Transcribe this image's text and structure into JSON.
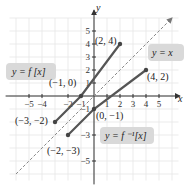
{
  "chart_data": {
    "type": "line",
    "title": "",
    "xlabel": "x",
    "ylabel": "y",
    "xlim": [
      -6,
      6
    ],
    "ylim": [
      -6,
      6
    ],
    "grid": true,
    "x_ticks": [
      "-5",
      "-4",
      "-2",
      "-1",
      "1",
      "2",
      "3",
      "4",
      "5"
    ],
    "y_ticks": [
      "5",
      "4",
      "3",
      "2",
      "1",
      "-1",
      "-3",
      "-5"
    ],
    "series": [
      {
        "name": "y = f(x)",
        "label": "y = f [x]",
        "points": [
          [
            -3,
            -2
          ],
          [
            -1,
            0
          ],
          [
            2,
            4
          ]
        ],
        "color": "#555555",
        "style": "solid"
      },
      {
        "name": "y = f^-1(x)",
        "label": "y = f ⁻¹[x]",
        "points": [
          [
            -2,
            -3
          ],
          [
            0,
            -1
          ],
          [
            4,
            2
          ]
        ],
        "color": "#555555",
        "style": "solid"
      },
      {
        "name": "y = x",
        "label": "y = x",
        "points": [
          [
            -6,
            -6
          ],
          [
            6,
            6
          ]
        ],
        "color": "#888888",
        "style": "dashed"
      }
    ],
    "annotations": [
      "(2, 4)",
      "(4, 2)",
      "(-1, 0)",
      "(0, -1)",
      "(-3, -2)",
      "(-2, -3)"
    ]
  },
  "labels": {
    "x_axis": "x",
    "y_axis": "y",
    "f": "y = f [x]",
    "finv": "y = f ⁻¹[x]",
    "identity": "y = x",
    "p24": "(2, 4)",
    "p42": "(4, 2)",
    "pm10": "(−1, 0)",
    "p0m1": "(0, −1)",
    "pm3m2": "(−3, −2)",
    "pm2m3": "(−2, −3)"
  },
  "ticks": {
    "x": [
      {
        "v": -5,
        "t": "−5"
      },
      {
        "v": -4,
        "t": "−4"
      },
      {
        "v": -2,
        "t": "−2"
      },
      {
        "v": -1,
        "t": "−1"
      },
      {
        "v": 1,
        "t": "1"
      },
      {
        "v": 2,
        "t": "2"
      },
      {
        "v": 3,
        "t": "3"
      },
      {
        "v": 4,
        "t": "4"
      },
      {
        "v": 5,
        "t": "5"
      }
    ],
    "y": [
      {
        "v": 5,
        "t": "5"
      },
      {
        "v": 4,
        "t": "4"
      },
      {
        "v": 3,
        "t": "3"
      },
      {
        "v": 2,
        "t": "2"
      },
      {
        "v": 1,
        "t": "1"
      },
      {
        "v": -1,
        "t": "−1"
      },
      {
        "v": -3,
        "t": "−3"
      },
      {
        "v": -5,
        "t": "−5"
      }
    ]
  }
}
